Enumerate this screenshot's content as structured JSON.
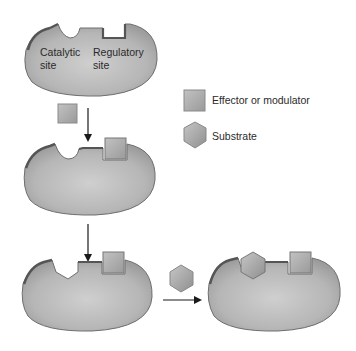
{
  "diagram": {
    "labels": {
      "catalytic_site": "Catalytic\nsite",
      "regulatory_site": "Regulatory\nsite"
    },
    "legend": [
      {
        "shape": "square",
        "label": "Effector or modulator"
      },
      {
        "shape": "hexagon",
        "label": "Substrate"
      }
    ],
    "steps": [
      {
        "id": 1,
        "description": "Enzyme with empty catalytic and regulatory sites"
      },
      {
        "id": 2,
        "description": "Effector binds regulatory site"
      },
      {
        "id": 3,
        "description": "Catalytic site changes shape"
      },
      {
        "id": 4,
        "description": "Substrate binds catalytic site"
      }
    ],
    "colors": {
      "enzyme_fill": "#b4b4b4",
      "enzyme_edge": "#6e6e6e",
      "ligand_fill": "#a9a9a9",
      "arrow": "#1a1a1a"
    }
  }
}
